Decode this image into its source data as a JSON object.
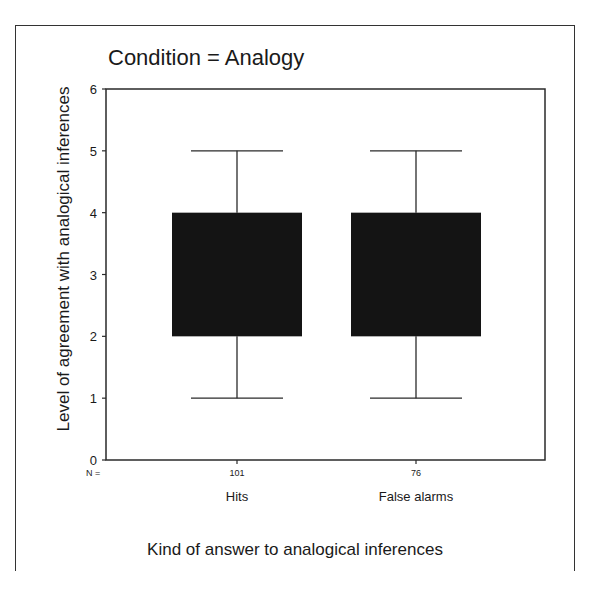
{
  "chart_data": {
    "type": "boxplot",
    "title": "Condition = Analogy",
    "xlabel": "Kind of answer to analogical inferences",
    "ylabel": "Level of agreement with analogical inferences",
    "ylim": [
      0,
      6
    ],
    "yticks": [
      "0",
      "1",
      "2",
      "3",
      "4",
      "5",
      "6"
    ],
    "grid": false,
    "legend": null,
    "n_label": "N =",
    "categories": [
      "Hits",
      "False alarms"
    ],
    "n": [
      "101",
      "76"
    ],
    "boxes": [
      {
        "category": "Hits",
        "n": 101,
        "whisker_low": 1,
        "q1": 2,
        "q3": 4,
        "whisker_high": 5
      },
      {
        "category": "False alarms",
        "n": 76,
        "whisker_low": 1,
        "q1": 2,
        "q3": 4,
        "whisker_high": 5
      }
    ],
    "box_color": "#141414"
  }
}
